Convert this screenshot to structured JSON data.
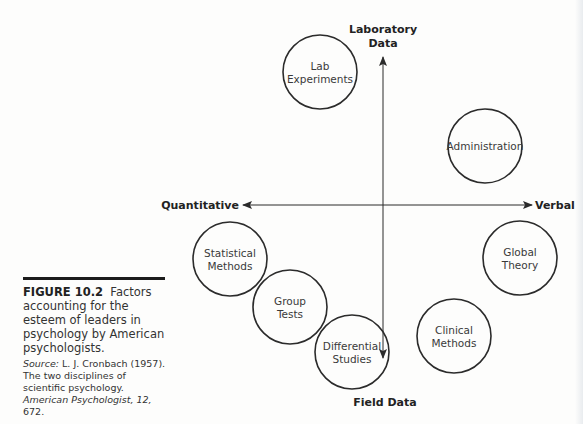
{
  "figure": {
    "number_label": "FIGURE 10.2",
    "title": "Factors accounting for the esteem of leaders in psychology by American psychologists.",
    "source": {
      "prefix": "Source:",
      "author_year": "L. J. Cronbach (1957).",
      "article": "The two disciplines of scientific psychology.",
      "journal": "American Psychologist,",
      "volume": "12,",
      "page": "672."
    }
  },
  "axes": {
    "top": [
      "Laboratory",
      "Data"
    ],
    "bottom": "Field Data",
    "left": "Quantitative",
    "right": "Verbal"
  },
  "nodes": [
    {
      "id": "lab-experiments",
      "lines": [
        "Lab",
        "Experiments"
      ],
      "cx": 320,
      "cy": 72
    },
    {
      "id": "administration",
      "lines": [
        "Administration"
      ],
      "cx": 485,
      "cy": 146
    },
    {
      "id": "statistical-methods",
      "lines": [
        "Statistical",
        "Methods"
      ],
      "cx": 230,
      "cy": 259
    },
    {
      "id": "global-theory",
      "lines": [
        "Global",
        "Theory"
      ],
      "cx": 520,
      "cy": 258
    },
    {
      "id": "group-tests",
      "lines": [
        "Group",
        "Tests"
      ],
      "cx": 290,
      "cy": 307
    },
    {
      "id": "clinical-methods",
      "lines": [
        "Clinical",
        "Methods"
      ],
      "cx": 454,
      "cy": 336
    },
    {
      "id": "differential-studies",
      "lines": [
        "Differential",
        "Studies"
      ],
      "cx": 352,
      "cy": 352
    }
  ],
  "style": {
    "stroke": "#2b2b2b",
    "radius": 37
  }
}
